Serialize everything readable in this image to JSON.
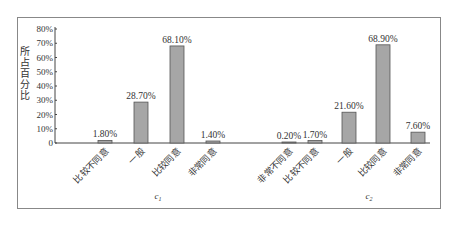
{
  "chart_data": {
    "type": "bar",
    "title": "",
    "xlabel": "",
    "ylabel": "所占百分比",
    "ylim": [
      0,
      80
    ],
    "yticks": [
      "0",
      "10%",
      "20%",
      "30%",
      "40%",
      "50%",
      "60%",
      "70%",
      "80%"
    ],
    "grid": false,
    "legend": null,
    "bar_color": "#a6a6a6",
    "groups": [
      {
        "name": "c1",
        "categories": [
          "比较不同意",
          "一般",
          "比较同意",
          "非常同意"
        ],
        "values": [
          1.8,
          28.7,
          68.1,
          1.4
        ],
        "labels": [
          "1.80%",
          "28.70%",
          "68.10%",
          "1.40%"
        ]
      },
      {
        "name": "c2",
        "categories": [
          "非常不同意",
          "比较不同意",
          "一般",
          "比较同意",
          "非常同意"
        ],
        "values": [
          0.2,
          1.7,
          21.6,
          68.9,
          7.6
        ],
        "labels": [
          "0.20%",
          "1.70%",
          "21.60%",
          "68.90%",
          "7.60%"
        ]
      }
    ]
  }
}
